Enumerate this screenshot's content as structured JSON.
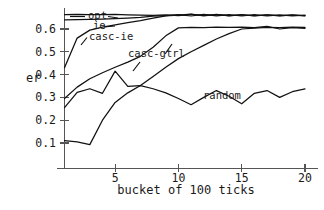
{
  "chart_data": {
    "type": "line",
    "title": "",
    "xlabel": "bucket of 100 ticks",
    "ylabel": "er",
    "xlim": [
      1,
      20
    ],
    "ylim": [
      0.0,
      0.7
    ],
    "xticks": [
      5,
      10,
      15,
      20
    ],
    "xticklabels": [
      "5",
      "10",
      "15",
      "20"
    ],
    "yticks": [
      0.1,
      0.2,
      0.3,
      0.4,
      0.5,
      0.6
    ],
    "yticklabels": [
      "0.1",
      "0.2",
      "0.3",
      "0.4",
      "0.5",
      "0.6"
    ],
    "grid": false,
    "legend_position": "inline-annotations",
    "line_color": "#111111",
    "axis_color": "#555555",
    "background": "#ffffff",
    "x": [
      1,
      2,
      3,
      4,
      5,
      6,
      7,
      8,
      9,
      10,
      11,
      12,
      13,
      14,
      15,
      16,
      17,
      18,
      19,
      20
    ],
    "series": [
      {
        "name": "opt",
        "label": "opt",
        "values": [
          0.663,
          0.664,
          0.663,
          0.663,
          0.664,
          0.662,
          0.661,
          0.66,
          0.662,
          0.659,
          0.664,
          0.66,
          0.663,
          0.659,
          0.662,
          0.659,
          0.662,
          0.659,
          0.661,
          0.659
        ]
      },
      {
        "name": "ie",
        "label": "ie",
        "values": [
          0.64,
          0.641,
          0.642,
          0.643,
          0.645,
          0.648,
          0.651,
          0.656,
          0.659,
          0.663,
          0.657,
          0.664,
          0.658,
          0.663,
          0.657,
          0.663,
          0.657,
          0.662,
          0.657,
          0.661
        ]
      },
      {
        "name": "casc-ie",
        "label": "casc-ie",
        "values": [
          0.43,
          0.56,
          0.595,
          0.608,
          0.618,
          0.628,
          0.637,
          0.648,
          0.658,
          0.661,
          0.665,
          0.658,
          0.664,
          0.658,
          0.663,
          0.657,
          0.662,
          0.658,
          0.662,
          0.658
        ]
      },
      {
        "name": "casc-gtrl",
        "label": "casc-gtrl",
        "values": [
          0.295,
          0.345,
          0.382,
          0.408,
          0.432,
          0.455,
          0.48,
          0.52,
          0.57,
          0.605,
          0.607,
          0.606,
          0.608,
          0.607,
          0.608,
          0.606,
          0.612,
          0.6,
          0.606,
          0.603
        ]
      },
      {
        "name": "random",
        "label": "random",
        "values": [
          0.255,
          0.322,
          0.338,
          0.318,
          0.415,
          0.348,
          0.352,
          0.338,
          0.32,
          0.295,
          0.268,
          0.3,
          0.33,
          0.305,
          0.272,
          0.318,
          0.33,
          0.3,
          0.325,
          0.337
        ]
      },
      {
        "name": "casc-gtrl-lower",
        "label": "",
        "values": [
          0.11,
          0.105,
          0.093,
          0.2,
          0.278,
          0.32,
          0.352,
          0.392,
          0.432,
          0.47,
          0.5,
          0.528,
          0.556,
          0.58,
          0.6,
          0.604,
          0.607,
          0.606,
          0.608,
          0.607
        ]
      }
    ],
    "annotations": [
      {
        "name": "opt",
        "text": "opt",
        "x_px": 88,
        "y_px": 19
      },
      {
        "name": "ie",
        "text": "ie",
        "x_px": 93,
        "y_px": 29
      },
      {
        "name": "casc-ie",
        "text": "casc-ie",
        "x_px": 89,
        "y_px": 40
      },
      {
        "name": "casc-gtrl",
        "text": "casc-gtrl",
        "x_px": 128,
        "y_px": 57
      },
      {
        "name": "random",
        "text": "random",
        "x_px": 203,
        "y_px": 99
      }
    ]
  }
}
